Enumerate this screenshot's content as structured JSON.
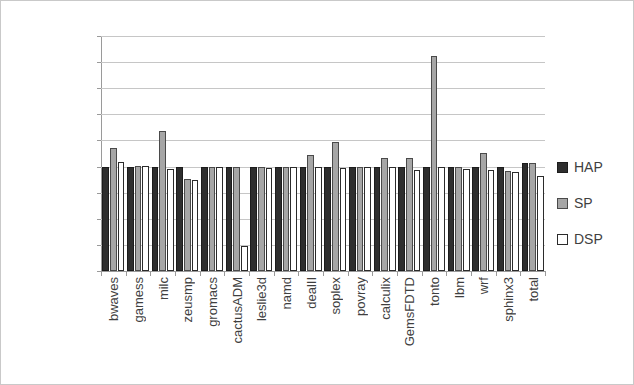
{
  "chart_data": {
    "type": "bar",
    "title": "",
    "subtitle": "",
    "xlabel": "",
    "ylabel": "",
    "ylim": [
      80,
      125
    ],
    "ytick_step": 5,
    "ytick_labels": [
      "125.00%",
      "120.00%",
      "115.00%",
      "110.00%",
      "105.00%",
      "100.00%",
      "95.00%",
      "90.00%",
      "85.00%",
      "80.00%"
    ],
    "ytick_values": [
      125,
      120,
      115,
      110,
      105,
      100,
      95,
      90,
      85,
      80
    ],
    "grid": "horizontal",
    "legend_position": "right",
    "categories": [
      "bwaves",
      "gamess",
      "milc",
      "zeusmp",
      "gromacs",
      "cactusADM",
      "leslie3d",
      "namd",
      "dealII",
      "soplex",
      "povray",
      "calculix",
      "GemsFDTD",
      "tonto",
      "lbm",
      "wrf",
      "sphinx3",
      "total"
    ],
    "series": [
      {
        "name": "HAP",
        "color": "#2e2e2e",
        "values": [
          100.0,
          100.0,
          100.0,
          100.0,
          100.0,
          100.0,
          100.0,
          100.0,
          100.0,
          100.0,
          100.0,
          100.0,
          100.0,
          100.0,
          100.0,
          100.0,
          100.0,
          100.6
        ]
      },
      {
        "name": "SP",
        "color": "#a6a6a6",
        "values": [
          103.5,
          100.1,
          106.8,
          97.7,
          100.0,
          100.0,
          100.0,
          100.0,
          102.2,
          104.8,
          100.0,
          101.7,
          101.7,
          121.2,
          100.0,
          102.6,
          99.1,
          100.6
        ]
      },
      {
        "name": "DSP",
        "color": "#ffffff",
        "values": [
          100.8,
          100.2,
          99.5,
          97.5,
          100.0,
          84.8,
          99.8,
          100.0,
          99.9,
          99.7,
          100.0,
          99.9,
          99.4,
          100.0,
          99.6,
          99.4,
          99.0,
          98.2
        ]
      }
    ]
  },
  "legend": {
    "items": [
      {
        "label": "HAP",
        "key": "hap"
      },
      {
        "label": "SP",
        "key": "sp"
      },
      {
        "label": "DSP",
        "key": "dsp"
      }
    ]
  }
}
